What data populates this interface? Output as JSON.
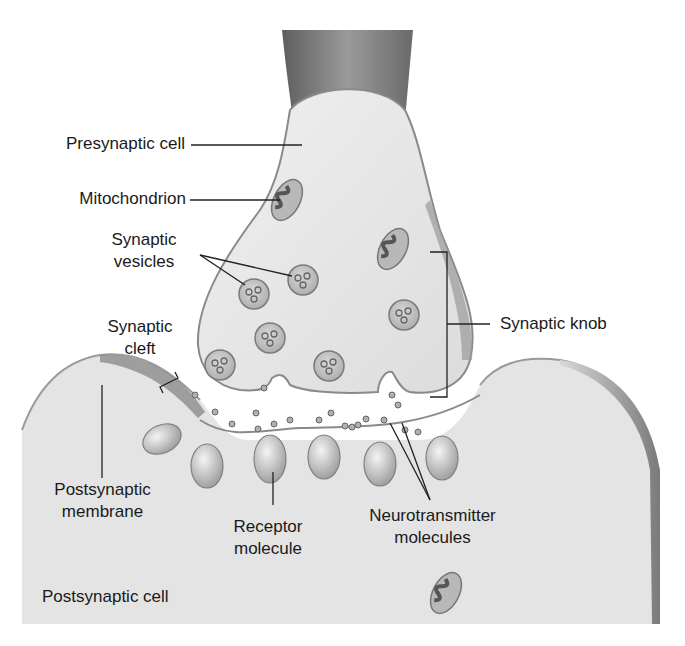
{
  "diagram": {
    "labels": {
      "presynaptic_cell": "Presynaptic cell",
      "mitochondrion": "Mitochondrion",
      "synaptic_vesicles_1": "Synaptic",
      "synaptic_vesicles_2": "vesicles",
      "synaptic_cleft_1": "Synaptic",
      "synaptic_cleft_2": "cleft",
      "synaptic_knob": "Synaptic knob",
      "postsynaptic_membrane_1": "Postsynaptic",
      "postsynaptic_membrane_2": "membrane",
      "receptor_molecule_1": "Receptor",
      "receptor_molecule_2": "molecule",
      "neurotransmitter_1": "Neurotransmitter",
      "neurotransmitter_2": "molecules",
      "postsynaptic_cell": "Postsynaptic cell"
    },
    "colors": {
      "cell_fill": "#e6e6e6",
      "membrane": "#8a8a8a",
      "axon_dark": "#6f6f6f",
      "vesicle_fill": "#c4c4c4",
      "mito_inner": "#555555",
      "leader_line": "#222222"
    }
  }
}
